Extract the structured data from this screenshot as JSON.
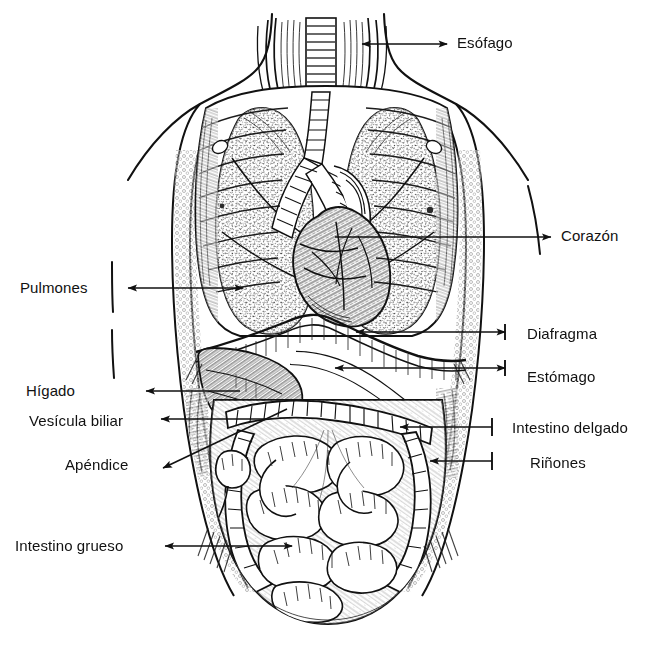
{
  "figure": {
    "kind": "anatomical-engraving",
    "language": "es",
    "background_color": "#ffffff",
    "ink_color": "#111111",
    "width": 645,
    "height": 656
  },
  "labels": [
    {
      "id": "esofago",
      "text": "Esófago",
      "side": "right",
      "x": 457,
      "y": 35,
      "arrow": {
        "type": "double",
        "x1": 447,
        "y1": 44,
        "x2": 362,
        "y2": 44,
        "head_start": true,
        "head_end": true
      }
    },
    {
      "id": "corazon",
      "text": "Corazón",
      "side": "right",
      "x": 561,
      "y": 228,
      "arrow": {
        "type": "single",
        "x1": 335,
        "y1": 237,
        "x2": 551,
        "y2": 237,
        "head_start": false,
        "head_end": true
      }
    },
    {
      "id": "pulmones",
      "text": "Pulmones",
      "side": "left",
      "x": 20,
      "y": 280,
      "arrow": {
        "type": "double",
        "x1": 128,
        "y1": 288,
        "x2": 243,
        "y2": 288,
        "head_start": true,
        "head_end": true
      }
    },
    {
      "id": "diafragma",
      "text": "Diafragma",
      "side": "right",
      "x": 527,
      "y": 326,
      "arrow": {
        "type": "double",
        "x1": 505,
        "y1": 332,
        "x2": 356,
        "y2": 332,
        "head_start": true,
        "head_end": true
      }
    },
    {
      "id": "estomago",
      "text": "Estómago",
      "side": "right",
      "x": 527,
      "y": 369,
      "arrow": {
        "type": "double",
        "x1": 505,
        "y1": 368,
        "x2": 335,
        "y2": 368,
        "head_start": true,
        "head_end": true
      }
    },
    {
      "id": "higado",
      "text": "Hígado",
      "side": "left",
      "x": 26,
      "y": 383,
      "arrow": {
        "type": "single",
        "x1": 240,
        "y1": 391,
        "x2": 146,
        "y2": 391,
        "head_start": false,
        "head_end": true
      }
    },
    {
      "id": "vesicula-biliar",
      "text": "Vesícula biliar",
      "side": "left",
      "x": 29,
      "y": 413,
      "arrow": {
        "type": "single",
        "x1": 268,
        "y1": 419,
        "x2": 161,
        "y2": 419,
        "head_start": false,
        "head_end": true
      }
    },
    {
      "id": "intestino-delgado",
      "text": "Intestino delgado",
      "side": "right",
      "x": 512,
      "y": 420,
      "arrow": {
        "type": "single",
        "x1": 492,
        "y1": 427,
        "x2": 400,
        "y2": 427,
        "head_start": false,
        "head_end": true
      }
    },
    {
      "id": "apendice",
      "text": "Apéndice",
      "side": "left",
      "x": 65,
      "y": 457,
      "arrow": {
        "type": "single",
        "x1": 287,
        "y1": 409,
        "x2": 163,
        "y2": 468,
        "head_start": false,
        "head_end": true
      }
    },
    {
      "id": "rinones",
      "text": "Riñones",
      "side": "right",
      "x": 530,
      "y": 455,
      "arrow": {
        "type": "single",
        "x1": 492,
        "y1": 461,
        "x2": 430,
        "y2": 461,
        "head_start": false,
        "head_end": true
      }
    },
    {
      "id": "intestino-grueso",
      "text": "Intestino grueso",
      "side": "left",
      "x": 15,
      "y": 538,
      "arrow": {
        "type": "double",
        "x1": 165,
        "y1": 546,
        "x2": 292,
        "y2": 546,
        "head_start": true,
        "head_end": true
      }
    }
  ]
}
